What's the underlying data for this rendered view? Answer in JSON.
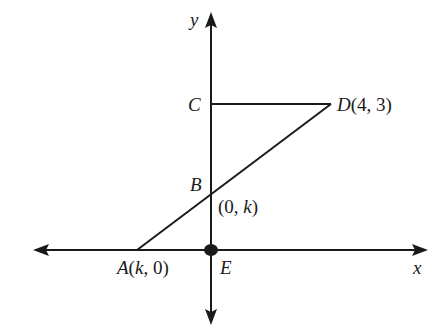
{
  "figure": {
    "type": "coordinate-geometry-diagram",
    "axes": {
      "x_label": "x",
      "y_label": "y"
    },
    "points": {
      "A": {
        "name": "A",
        "coord_text": "(k, 0)",
        "name_k": "k",
        "rest": ", 0)"
      },
      "B": {
        "name": "B",
        "coord_text": "(0, k)"
      },
      "C": {
        "name": "C"
      },
      "D": {
        "name": "D",
        "coord_text": "(4, 3)"
      },
      "E": {
        "name": "E"
      }
    },
    "segments": [
      {
        "from": "C",
        "to": "D"
      },
      {
        "from": "D",
        "to": "A"
      }
    ],
    "labels": {
      "y": "y",
      "x": "x",
      "C": "C",
      "D_name": "D",
      "D_coord": "(4, 3)",
      "B": "B",
      "B_coord_open": "(0, ",
      "B_coord_k": "k",
      "B_coord_close": ")",
      "A_name": "A",
      "A_open": "(",
      "A_k": "k",
      "A_close": ", 0)",
      "E": "E"
    },
    "colors": {
      "ink": "#1a1a1a",
      "background": "#ffffff"
    }
  }
}
